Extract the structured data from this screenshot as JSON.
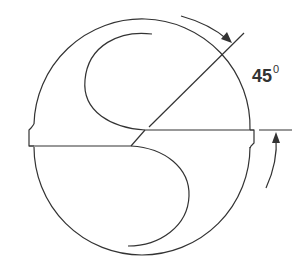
{
  "diagram": {
    "angle_label": {
      "value": "45",
      "unit_superscript": "0"
    },
    "colors": {
      "stroke": "#333333",
      "background": "#ffffff"
    }
  }
}
